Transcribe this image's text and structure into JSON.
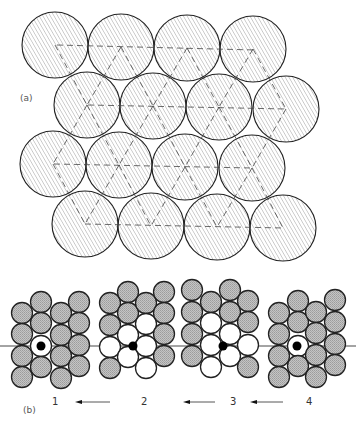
{
  "labels": {
    "part_a": "(a)",
    "part_b": "(b)",
    "step1": "1",
    "step2": "2",
    "step3": "3",
    "step4": "4"
  },
  "colors": {
    "hatch_stroke": "#9a9a9a",
    "circle_outline": "#222222",
    "gray_atom": "#b9b9b9",
    "white_atom": "#ffffff",
    "adatom": "#000000",
    "dashed_line": "#444444"
  },
  "part_a": {
    "radius": 33,
    "rows": [
      [
        [
          55,
          45
        ],
        [
          121,
          47
        ],
        [
          187,
          48
        ],
        [
          253,
          49
        ]
      ],
      [
        [
          87,
          105
        ],
        [
          153,
          106
        ],
        [
          219,
          107
        ],
        [
          286,
          109
        ]
      ],
      [
        [
          53,
          164
        ],
        [
          119,
          165
        ],
        [
          185,
          167
        ],
        [
          252,
          168
        ]
      ],
      [
        [
          85,
          224
        ],
        [
          151,
          226
        ],
        [
          217,
          227
        ],
        [
          283,
          228
        ]
      ]
    ],
    "horizontal_dashes": [
      [
        57,
        45,
        255,
        50
      ],
      [
        88,
        105,
        286,
        109
      ],
      [
        54,
        164,
        252,
        168
      ],
      [
        85,
        224,
        284,
        228
      ]
    ],
    "diagonal_dashes": [
      [
        55,
        45,
        87,
        105
      ],
      [
        87,
        105,
        53,
        164
      ],
      [
        53,
        164,
        85,
        224
      ],
      [
        121,
        47,
        87,
        105
      ],
      [
        87,
        105,
        119,
        165
      ],
      [
        119,
        165,
        85,
        224
      ],
      [
        121,
        47,
        153,
        106
      ],
      [
        153,
        106,
        119,
        165
      ],
      [
        119,
        165,
        151,
        226
      ],
      [
        187,
        48,
        153,
        106
      ],
      [
        153,
        106,
        185,
        167
      ],
      [
        185,
        167,
        151,
        226
      ],
      [
        187,
        48,
        219,
        107
      ],
      [
        219,
        107,
        185,
        167
      ],
      [
        185,
        167,
        217,
        227
      ],
      [
        253,
        49,
        219,
        107
      ],
      [
        219,
        107,
        252,
        168
      ],
      [
        252,
        168,
        217,
        227
      ],
      [
        253,
        49,
        286,
        109
      ],
      [
        286,
        109,
        252,
        168
      ],
      [
        252,
        168,
        283,
        228
      ]
    ]
  },
  "part_b": {
    "radius": 10.5,
    "baseline_y": 346,
    "baseline": [
      0,
      356
    ],
    "clusters": [
      {
        "step": 1,
        "atoms": [
          [
            22,
            313,
            "g"
          ],
          [
            22,
            334,
            "g"
          ],
          [
            22,
            356,
            "g"
          ],
          [
            22,
            377,
            "g"
          ],
          [
            41,
            302,
            "g"
          ],
          [
            41,
            323,
            "g"
          ],
          [
            41,
            346,
            "w"
          ],
          [
            41,
            367,
            "g"
          ],
          [
            61,
            313,
            "g"
          ],
          [
            61,
            335,
            "g"
          ],
          [
            61,
            356,
            "g"
          ],
          [
            61,
            378,
            "g"
          ],
          [
            79,
            302,
            "g"
          ],
          [
            79,
            323,
            "g"
          ],
          [
            79,
            345,
            "g"
          ],
          [
            79,
            366,
            "g"
          ]
        ],
        "adatom": [
          41,
          346
        ]
      },
      {
        "step": 2,
        "atoms": [
          [
            110,
            303,
            "g"
          ],
          [
            110,
            325,
            "g"
          ],
          [
            110,
            347,
            "w"
          ],
          [
            110,
            368,
            "g"
          ],
          [
            128,
            292,
            "g"
          ],
          [
            128,
            313,
            "g"
          ],
          [
            128,
            335,
            "w"
          ],
          [
            128,
            357,
            "w"
          ],
          [
            146,
            303,
            "g"
          ],
          [
            146,
            324,
            "w"
          ],
          [
            146,
            346,
            "w"
          ],
          [
            146,
            368,
            "w"
          ],
          [
            164,
            292,
            "g"
          ],
          [
            164,
            313,
            "g"
          ],
          [
            164,
            334,
            "g"
          ],
          [
            164,
            356,
            "g"
          ]
        ],
        "adatom": [
          133,
          346
        ]
      },
      {
        "step": 3,
        "atoms": [
          [
            192,
            290,
            "g"
          ],
          [
            192,
            312,
            "g"
          ],
          [
            192,
            334,
            "g"
          ],
          [
            192,
            356,
            "g"
          ],
          [
            211,
            302,
            "g"
          ],
          [
            211,
            323,
            "w"
          ],
          [
            211,
            345,
            "w"
          ],
          [
            211,
            367,
            "w"
          ],
          [
            230,
            290,
            "g"
          ],
          [
            230,
            312,
            "g"
          ],
          [
            230,
            334,
            "w"
          ],
          [
            230,
            356,
            "w"
          ],
          [
            248,
            301,
            "g"
          ],
          [
            248,
            322,
            "g"
          ],
          [
            248,
            345,
            "w"
          ],
          [
            248,
            367,
            "g"
          ]
        ],
        "adatom": [
          223,
          346
        ]
      },
      {
        "step": 4,
        "atoms": [
          [
            279,
            313,
            "g"
          ],
          [
            279,
            334,
            "g"
          ],
          [
            279,
            356,
            "g"
          ],
          [
            279,
            377,
            "g"
          ],
          [
            298,
            301,
            "g"
          ],
          [
            298,
            322,
            "g"
          ],
          [
            298,
            346,
            "w"
          ],
          [
            298,
            366,
            "g"
          ],
          [
            316,
            312,
            "g"
          ],
          [
            316,
            333,
            "g"
          ],
          [
            316,
            355,
            "g"
          ],
          [
            316,
            377,
            "g"
          ],
          [
            335,
            300,
            "g"
          ],
          [
            335,
            322,
            "g"
          ],
          [
            335,
            344,
            "g"
          ],
          [
            335,
            365,
            "g"
          ]
        ],
        "adatom": [
          297,
          346
        ]
      }
    ],
    "arrows": [
      {
        "from": [
          110,
          402
        ],
        "to": [
          75,
          402
        ]
      },
      {
        "from": [
          215,
          402
        ],
        "to": [
          183,
          402
        ]
      },
      {
        "from": [
          283,
          402
        ],
        "to": [
          250,
          402
        ]
      }
    ]
  }
}
